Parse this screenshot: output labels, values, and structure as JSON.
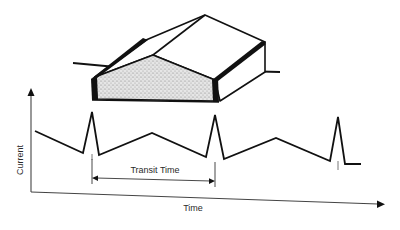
{
  "figure": {
    "type": "diagram"
  },
  "device": {
    "front_face_fill": "stippled-gray",
    "contacts": [
      "left-electrode",
      "right-electrode"
    ],
    "leads": [
      "left-lead",
      "right-lead"
    ]
  },
  "plot": {
    "y_axis_label": "Current",
    "x_axis_label": "Time",
    "annotation": {
      "label": "Transit Time",
      "start_x": 92,
      "end_x": 215
    },
    "waveform_points": [
      [
        35,
        131
      ],
      [
        83,
        153
      ],
      [
        92,
        112
      ],
      [
        99,
        155
      ],
      [
        152,
        133
      ],
      [
        206,
        157
      ],
      [
        215,
        115
      ],
      [
        224,
        159
      ],
      [
        276,
        138
      ],
      [
        330,
        161
      ],
      [
        338,
        117
      ],
      [
        345,
        164
      ],
      [
        361,
        164
      ]
    ],
    "peaks": 3
  },
  "colors": {
    "ink": "#111111",
    "axis": "#333333",
    "stipple": "#bdbdbd",
    "background": "#ffffff"
  }
}
